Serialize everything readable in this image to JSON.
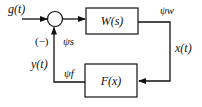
{
  "diagram": {
    "type": "feedback-loop block diagram",
    "input_label": "g(t)",
    "minus_sign": "(−)",
    "forward_block": {
      "label": "W(s)"
    },
    "feedback_block": {
      "label": "F(x)"
    },
    "output_label": "x(t)",
    "feedback_signal_label": "y(t)",
    "psi_s": "ψs",
    "psi_w": "ψw",
    "psi_f": "ψf",
    "colors": {
      "line": "#111111",
      "background": "#ffffff"
    }
  }
}
